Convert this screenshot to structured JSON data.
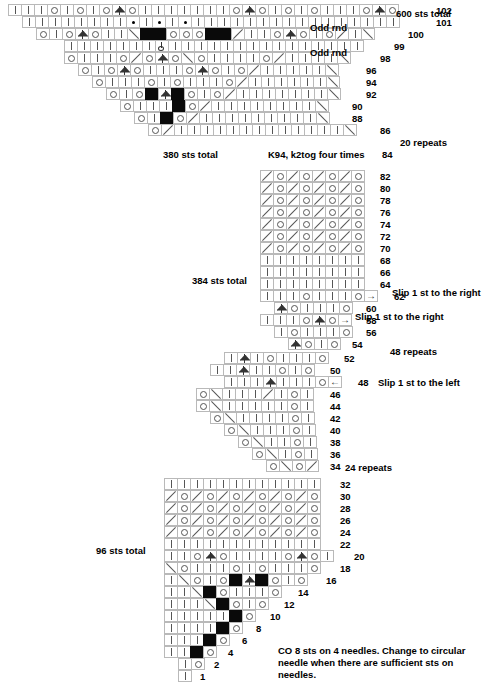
{
  "document": {
    "title": "Lace Shawl Knitting Chart",
    "type": "knitting-chart"
  },
  "symbol_key": {
    "knit": "knit stitch (vertical bar)",
    "yo": "yarn over (open circle)",
    "k2tog": "knit 2 together (right-leaning slash)",
    "ssk": "slip slip knit (left-leaning slash)",
    "cdd": "central double decrease (peaked triangle)",
    "purl": "purl stitch (filled dot)",
    "dark": "no stitch (solid black square)",
    "arrow_right": "slip 1 st to the right",
    "arrow_left": "slip 1 st to the left",
    "slipknot": "slip stitch marker"
  },
  "sections": [
    {
      "name": "top-section",
      "sts_total_label": "600 sts total",
      "secondary_total_label": "380 sts total",
      "repeats_label": "20 repeats",
      "instruction_label": "K94, k2tog four times",
      "rows": [
        {
          "number": "102",
          "indent": 0,
          "note": "",
          "cells": [
            "knit",
            "knit",
            "knit",
            "yo",
            "knit",
            "yo",
            "knit",
            "yo",
            "cdd",
            "yo",
            "knit",
            "knit",
            "knit",
            "knit",
            "knit",
            "knit",
            "knit",
            "yo",
            "cdd",
            "yo",
            "knit",
            "yo",
            "knit",
            "yo",
            "knit",
            "knit",
            "knit",
            "yo",
            "cdd",
            "yo"
          ]
        },
        {
          "number": "101",
          "indent": 1,
          "note": "Odd rnd",
          "cells": [
            "knit",
            "knit",
            "knit",
            "knit",
            "knit",
            "knit",
            "knit",
            "knit",
            "purl",
            "knit",
            "purl",
            "knit",
            "purl",
            "knit",
            "knit",
            "knit",
            "knit",
            "knit",
            "knit",
            "knit",
            "knit",
            "knit",
            "knit",
            "knit",
            "knit",
            "knit",
            "knit",
            "knit",
            "knit"
          ]
        },
        {
          "number": "100",
          "indent": 2,
          "note": "",
          "cells": [
            "yo",
            "knit",
            "yo",
            "cdd",
            "yo",
            "knit",
            "knit",
            "ssk",
            "dark",
            "dark",
            "yo",
            "yo",
            "yo",
            "dark",
            "dark",
            "k2tog",
            "knit",
            "knit",
            "yo",
            "cdd",
            "yo",
            "knit",
            "yo",
            "k2tog",
            "knit",
            "ssk"
          ]
        },
        {
          "number": "99",
          "indent": 4,
          "note": "Odd rnd",
          "cells": [
            "knit",
            "knit",
            "knit",
            "knit",
            "knit",
            "knit",
            "knit",
            "slipknot",
            "knit",
            "knit",
            "knit",
            "knit",
            "knit",
            "knit",
            "knit",
            "knit",
            "knit",
            "knit",
            "knit",
            "knit",
            "knit",
            "knit",
            "knit"
          ]
        },
        {
          "number": "98",
          "indent": 4,
          "note": "",
          "cells": [
            "yo",
            "knit",
            "knit",
            "knit",
            "yo",
            "k2tog",
            "yo",
            "cdd",
            "yo",
            "ssk",
            "yo",
            "knit",
            "knit",
            "knit",
            "knit",
            "yo",
            "k2tog",
            "knit",
            "knit",
            "knit",
            "knit",
            "ssk"
          ]
        },
        {
          "number": "96",
          "indent": 5,
          "note": "",
          "cells": [
            "yo",
            "knit",
            "yo",
            "cdd",
            "yo",
            "knit",
            "knit",
            "knit",
            "yo",
            "cdd",
            "yo",
            "knit",
            "yo",
            "k2tog",
            "knit",
            "knit",
            "knit",
            "knit",
            "knit",
            "ssk"
          ]
        },
        {
          "number": "94",
          "indent": 6,
          "note": "",
          "cells": [
            "yo",
            "knit",
            "knit",
            "knit",
            "yo",
            "knit",
            "yo",
            "knit",
            "knit",
            "knit",
            "yo",
            "k2tog",
            "knit",
            "knit",
            "knit",
            "knit",
            "knit",
            "knit",
            "ssk"
          ]
        },
        {
          "number": "92",
          "indent": 7,
          "note": "",
          "cells": [
            "yo",
            "knit",
            "yo",
            "dark",
            "cdd",
            "dark",
            "yo",
            "knit",
            "yo",
            "k2tog",
            "knit",
            "knit",
            "knit",
            "knit",
            "knit",
            "knit",
            "knit",
            "ssk"
          ]
        },
        {
          "number": "90",
          "indent": 8,
          "note": "",
          "cells": [
            "yo",
            "knit",
            "knit",
            "knit",
            "dark",
            "yo",
            "k2tog",
            "knit",
            "knit",
            "knit",
            "knit",
            "knit",
            "knit",
            "knit",
            "knit",
            "ssk"
          ]
        },
        {
          "number": "88",
          "indent": 9,
          "note": "",
          "cells": [
            "yo",
            "knit",
            "dark",
            "yo",
            "k2tog",
            "knit",
            "knit",
            "knit",
            "knit",
            "knit",
            "knit",
            "knit",
            "knit",
            "knit",
            "ssk"
          ]
        },
        {
          "number": "86",
          "indent": 10,
          "note": "",
          "cells": [
            "yo",
            "k2tog",
            "knit",
            "knit",
            "knit",
            "knit",
            "knit",
            "knit",
            "knit",
            "knit",
            "knit",
            "knit",
            "knit",
            "knit",
            "knit",
            "ssk"
          ]
        }
      ],
      "row84_number": "84"
    },
    {
      "name": "second-section",
      "sts_total_label": "384 sts total",
      "repeats_label": "48 repeats",
      "rows": [
        {
          "number": "82",
          "indent": 0,
          "note": "",
          "cells": [
            "k2tog",
            "yo",
            "k2tog",
            "yo",
            "k2tog",
            "yo",
            "k2tog",
            "yo"
          ]
        },
        {
          "number": "80",
          "indent": 0,
          "note": "",
          "cells": [
            "k2tog",
            "yo",
            "k2tog",
            "yo",
            "k2tog",
            "yo",
            "k2tog",
            "yo"
          ]
        },
        {
          "number": "78",
          "indent": 0,
          "note": "",
          "cells": [
            "k2tog",
            "yo",
            "k2tog",
            "yo",
            "k2tog",
            "yo",
            "k2tog",
            "yo"
          ]
        },
        {
          "number": "76",
          "indent": 0,
          "note": "",
          "cells": [
            "k2tog",
            "yo",
            "k2tog",
            "yo",
            "k2tog",
            "yo",
            "k2tog",
            "yo"
          ]
        },
        {
          "number": "74",
          "indent": 0,
          "note": "",
          "cells": [
            "k2tog",
            "yo",
            "k2tog",
            "yo",
            "k2tog",
            "yo",
            "k2tog",
            "yo"
          ]
        },
        {
          "number": "72",
          "indent": 0,
          "note": "",
          "cells": [
            "k2tog",
            "yo",
            "k2tog",
            "yo",
            "k2tog",
            "yo",
            "k2tog",
            "yo"
          ]
        },
        {
          "number": "70",
          "indent": 0,
          "note": "",
          "cells": [
            "k2tog",
            "yo",
            "k2tog",
            "yo",
            "k2tog",
            "yo",
            "k2tog",
            "yo"
          ]
        },
        {
          "number": "68",
          "indent": 0,
          "note": "",
          "cells": [
            "knit",
            "knit",
            "knit",
            "knit",
            "knit",
            "knit",
            "knit",
            "knit"
          ]
        },
        {
          "number": "66",
          "indent": 0,
          "note": "",
          "cells": [
            "knit",
            "knit",
            "knit",
            "knit",
            "knit",
            "knit",
            "knit",
            "knit"
          ]
        },
        {
          "number": "64",
          "indent": 0,
          "note": "",
          "cells": [
            "knit",
            "knit",
            "knit",
            "knit",
            "knit",
            "knit",
            "knit",
            "knit"
          ]
        },
        {
          "number": "62",
          "indent": 0,
          "note": "Slip 1 st to the right",
          "cells": [
            "knit",
            "knit",
            "knit",
            "yo",
            "knit",
            "knit",
            "knit",
            "yo",
            "arrow_right"
          ]
        },
        {
          "number": "60",
          "indent": 1,
          "note": "",
          "cells": [
            "cdd",
            "yo",
            "knit",
            "knit",
            "knit",
            "yo"
          ]
        },
        {
          "number": "58",
          "indent": 0,
          "note": "Slip 1 st to the right",
          "cells": [
            "knit",
            "knit",
            "knit",
            "yo",
            "cdd",
            "yo",
            "arrow_right"
          ]
        },
        {
          "number": "56",
          "indent": 1,
          "note": "",
          "cells": [
            "knit",
            "yo",
            "knit",
            "knit",
            "knit",
            "yo"
          ]
        },
        {
          "number": "54",
          "indent": 2,
          "note": "",
          "cells": [
            "cdd",
            "yo",
            "knit",
            "yo"
          ]
        }
      ]
    },
    {
      "name": "third-section",
      "repeats_label": "24 repeats",
      "rows": [
        {
          "number": "52",
          "indent": 2,
          "note": "",
          "cells": [
            "knit",
            "cdd",
            "knit",
            "yo",
            "knit",
            "knit",
            "knit",
            "yo"
          ]
        },
        {
          "number": "50",
          "indent": 1,
          "note": "",
          "cells": [
            "knit",
            "knit",
            "cdd",
            "knit",
            "knit",
            "yo",
            "knit",
            "yo"
          ]
        },
        {
          "number": "48",
          "indent": 2,
          "note": "Slip 1 st to the left",
          "cells": [
            "knit",
            "knit",
            "knit",
            "cdd",
            "knit",
            "knit",
            "knit",
            "yo",
            "arrow_left"
          ]
        },
        {
          "number": "46",
          "indent": 0,
          "note": "",
          "cells": [
            "yo",
            "ssk",
            "knit",
            "knit",
            "knit",
            "k2tog",
            "knit",
            "yo",
            "knit"
          ]
        },
        {
          "number": "44",
          "indent": 0,
          "note": "",
          "cells": [
            "yo",
            "ssk",
            "knit",
            "knit",
            "knit",
            "knit",
            "knit",
            "yo",
            "knit"
          ]
        },
        {
          "number": "42",
          "indent": 1,
          "note": "",
          "cells": [
            "yo",
            "ssk",
            "knit",
            "knit",
            "knit",
            "knit",
            "yo",
            "knit"
          ]
        },
        {
          "number": "40",
          "indent": 2,
          "note": "",
          "cells": [
            "yo",
            "ssk",
            "knit",
            "knit",
            "knit",
            "yo",
            "knit"
          ]
        },
        {
          "number": "38",
          "indent": 3,
          "note": "",
          "cells": [
            "yo",
            "ssk",
            "knit",
            "knit",
            "yo",
            "knit"
          ]
        },
        {
          "number": "36",
          "indent": 4,
          "note": "",
          "cells": [
            "yo",
            "ssk",
            "knit",
            "yo",
            "knit"
          ]
        },
        {
          "number": "34",
          "indent": 5,
          "note": "",
          "cells": [
            "yo",
            "ssk",
            "yo",
            "k2tog"
          ]
        }
      ]
    },
    {
      "name": "bottom-section",
      "sts_total_label": "96 sts total",
      "repeats_label": "24 repeats",
      "cast_on_note": "CO 8 sts on 4 needles. Change to circular needle when there are sufficient sts on needles.",
      "rows": [
        {
          "number": "32",
          "indent": 0,
          "note": "",
          "cells": [
            "knit",
            "knit",
            "knit",
            "knit",
            "knit",
            "knit",
            "knit",
            "knit",
            "knit",
            "knit",
            "knit",
            "knit"
          ]
        },
        {
          "number": "30",
          "indent": 0,
          "note": "",
          "cells": [
            "k2tog",
            "yo",
            "k2tog",
            "yo",
            "k2tog",
            "yo",
            "k2tog",
            "yo",
            "k2tog",
            "yo",
            "k2tog",
            "yo"
          ]
        },
        {
          "number": "28",
          "indent": 0,
          "note": "",
          "cells": [
            "k2tog",
            "yo",
            "k2tog",
            "yo",
            "k2tog",
            "yo",
            "k2tog",
            "yo",
            "k2tog",
            "yo",
            "k2tog",
            "yo"
          ]
        },
        {
          "number": "26",
          "indent": 0,
          "note": "",
          "cells": [
            "k2tog",
            "yo",
            "k2tog",
            "yo",
            "k2tog",
            "yo",
            "k2tog",
            "yo",
            "k2tog",
            "yo",
            "k2tog",
            "yo"
          ]
        },
        {
          "number": "24",
          "indent": 0,
          "note": "",
          "cells": [
            "k2tog",
            "yo",
            "k2tog",
            "yo",
            "k2tog",
            "yo",
            "k2tog",
            "yo",
            "k2tog",
            "yo",
            "k2tog",
            "yo"
          ]
        },
        {
          "number": "22",
          "indent": 0,
          "note": "",
          "cells": [
            "knit",
            "knit",
            "knit",
            "knit",
            "knit",
            "knit",
            "knit",
            "knit",
            "knit",
            "knit",
            "knit",
            "knit"
          ]
        },
        {
          "number": "20",
          "indent": 0,
          "note": "",
          "cells": [
            "knit",
            "knit",
            "yo",
            "cdd",
            "yo",
            "knit",
            "knit",
            "knit",
            "knit",
            "yo",
            "cdd",
            "yo",
            "knit"
          ]
        },
        {
          "number": "18",
          "indent": 0,
          "note": "",
          "cells": [
            "ssk",
            "yo",
            "knit",
            "knit",
            "knit",
            "yo",
            "knit",
            "yo",
            "knit",
            "knit",
            "knit",
            "yo"
          ]
        },
        {
          "number": "16",
          "indent": 0,
          "note": "",
          "cells": [
            "knit",
            "ssk",
            "yo",
            "knit",
            "yo",
            "dark",
            "cdd",
            "dark",
            "yo",
            "knit",
            "yo"
          ]
        },
        {
          "number": "14",
          "indent": 0,
          "note": "",
          "cells": [
            "knit",
            "knit",
            "ssk",
            "dark",
            "yo",
            "knit",
            "knit",
            "knit",
            "yo"
          ]
        },
        {
          "number": "12",
          "indent": 0,
          "note": "",
          "cells": [
            "knit",
            "knit",
            "knit",
            "ssk",
            "dark",
            "yo",
            "knit",
            "yo"
          ]
        },
        {
          "number": "10",
          "indent": 0,
          "note": "",
          "cells": [
            "knit",
            "knit",
            "knit",
            "knit",
            "knit",
            "dark",
            "yo"
          ]
        },
        {
          "number": "8",
          "indent": 0,
          "note": "",
          "cells": [
            "knit",
            "knit",
            "knit",
            "knit",
            "dark",
            "yo"
          ]
        },
        {
          "number": "6",
          "indent": 0,
          "note": "",
          "cells": [
            "knit",
            "knit",
            "knit",
            "dark",
            "yo"
          ]
        },
        {
          "number": "4",
          "indent": 0,
          "note": "",
          "cells": [
            "knit",
            "knit",
            "dark",
            "yo"
          ]
        },
        {
          "number": "2",
          "indent": 1,
          "note": "",
          "cells": [
            "knit",
            "yo"
          ]
        },
        {
          "number": "1",
          "indent": 1,
          "note": "",
          "cells": [
            "knit"
          ]
        }
      ]
    }
  ]
}
